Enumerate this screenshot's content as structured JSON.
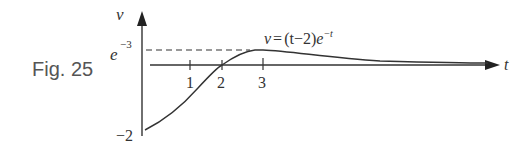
{
  "figure": {
    "label": "Fig. 25",
    "equation": "v = (t−2)e⁻ᵗ",
    "equation_parts": {
      "lhs": "v",
      "eq": "=",
      "factor": "(t−2)",
      "base": "e",
      "exponent": "−t"
    },
    "y_axis_label": "v",
    "x_axis_label": "t",
    "y_max_label_base": "e",
    "y_max_label_exp": "−3",
    "y_min_label": "−2",
    "x_ticks": [
      "1",
      "2",
      "3"
    ]
  },
  "colors": {
    "line": "#333333",
    "label": "#555555"
  }
}
